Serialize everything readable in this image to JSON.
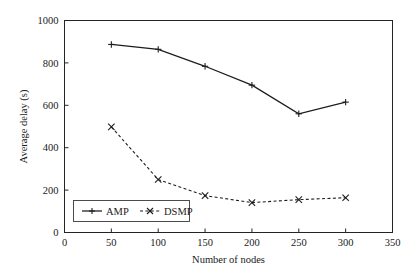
{
  "chart_data": {
    "type": "line",
    "title": "",
    "xlabel": "Number of nodes",
    "ylabel": "Average delay (s)",
    "xlim": [
      0,
      350
    ],
    "ylim": [
      0,
      1000
    ],
    "xticks": [
      0,
      50,
      100,
      150,
      200,
      250,
      300,
      350
    ],
    "yticks": [
      0,
      200,
      400,
      600,
      800,
      1000
    ],
    "xtick_labels": [
      "0",
      "50",
      "100",
      "150",
      "200",
      "250",
      "300",
      "350"
    ],
    "ytick_labels": [
      "0",
      "200",
      "400",
      "600",
      "800",
      "1000"
    ],
    "grid": false,
    "legend_position": "lower left",
    "x": [
      50,
      100,
      150,
      200,
      250,
      300
    ],
    "series": [
      {
        "name": "AMP",
        "values": [
          887,
          864,
          784,
          695,
          560,
          615
        ],
        "line_style": "solid",
        "marker": "plus",
        "color": "#1c1c1c"
      },
      {
        "name": "DSMP",
        "values": [
          498,
          250,
          174,
          141,
          155,
          164
        ],
        "line_style": "dashed",
        "marker": "x",
        "color": "#1c1c1c"
      }
    ]
  },
  "legend": {
    "entries": [
      {
        "label": "AMP"
      },
      {
        "label": "DSMP"
      }
    ]
  },
  "axes": {
    "x_title": "Number of nodes",
    "y_title": "Average delay (s)"
  }
}
